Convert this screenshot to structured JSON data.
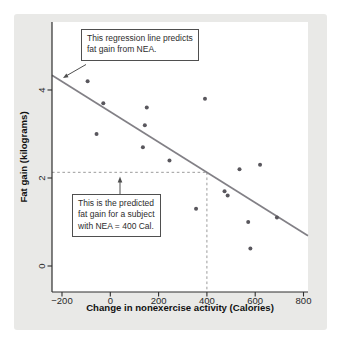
{
  "figure": {
    "kind": "textbook scatterplot with regression line",
    "panel_background": "#e9e9e7"
  },
  "chart_data": {
    "type": "scatter",
    "title": "",
    "xlabel": "Change in nonexercise activity (Calories)",
    "ylabel": "Fat gain (kilograms)",
    "x_ticks": {
      "values": [
        -200,
        0,
        200,
        400,
        600,
        800
      ],
      "labels": [
        "−200",
        "0",
        "200",
        "400",
        "600",
        "800"
      ]
    },
    "y_ticks": {
      "values": [
        0,
        2,
        4
      ],
      "labels": [
        "0",
        "2",
        "4"
      ]
    },
    "xlim_calories": [
      -241.4,
      818.6
    ],
    "ylim_kilograms": [
      -0.591,
      5.545
    ],
    "grid": false,
    "legend": null,
    "points_nea_vs_fatgain": [
      [
        -94,
        4.2
      ],
      [
        -57,
        3.0
      ],
      [
        -29,
        3.7
      ],
      [
        135,
        2.7
      ],
      [
        143,
        3.2
      ],
      [
        151,
        3.6
      ],
      [
        245,
        2.4
      ],
      [
        355,
        1.3
      ],
      [
        392,
        3.8
      ],
      [
        473,
        1.7
      ],
      [
        486,
        1.6
      ],
      [
        535,
        2.2
      ],
      [
        571,
        1.0
      ],
      [
        580,
        0.4
      ],
      [
        620,
        2.3
      ],
      [
        690,
        1.1
      ]
    ],
    "regression": {
      "intercept_kg": 3.505,
      "slope_kg_per_cal": -0.00344
    },
    "prediction": {
      "nea_calories": 400,
      "predicted_fat_gain_kg": 2.13
    },
    "colors": {
      "point": "#59575d",
      "regression_line": "#828086",
      "dashed_line": "#9b9b9b",
      "axis": "#2e2e2e",
      "arrow": "#4f4f4f"
    }
  },
  "annotations": {
    "regression_note": "This regression line predicts\nfat gain from NEA.",
    "prediction_note": "This is the predicted\nfat gain for a subject\nwith NEA = 400 Cal."
  }
}
